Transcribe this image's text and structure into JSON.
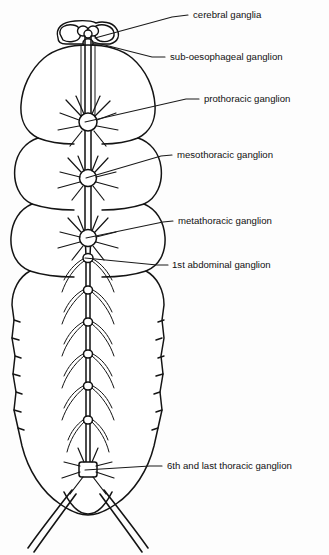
{
  "figure": {
    "background_color": "#fdfdfd",
    "ink_color": "#141414",
    "labels": [
      {
        "id": "cerebral-ganglia",
        "text": "cerebral ganglia",
        "text_x": 193,
        "text_y": 15,
        "leader": "M 188 15 L 172 17 L 95 38"
      },
      {
        "id": "sub-oesophageal-ganglion",
        "text": "sub-oesophageal ganglion",
        "text_x": 170,
        "text_y": 57,
        "leader": "M 165 57 L 152 57 L 93 42"
      },
      {
        "id": "prothoracic-ganglion",
        "text": "prothoracic ganglion",
        "text_x": 204,
        "text_y": 99,
        "leader": "M 199 99 L 186 99 L 85 122"
      },
      {
        "id": "mesothoracic-ganglion",
        "text": "mesothoracic ganglion",
        "text_x": 177,
        "text_y": 155,
        "leader": "M 172 155 L 161 156 L 86 178"
      },
      {
        "id": "metathoracic-ganglion",
        "text": "metathoracic ganglion",
        "text_x": 178,
        "text_y": 221,
        "leader": "M 173 221 L 163 222 L 86 238"
      },
      {
        "id": "first-abdominal-ganglion",
        "text": "1st abdominal ganglion",
        "text_x": 172,
        "text_y": 265,
        "leader": "M 168 265 L 157 265 L 85 258"
      },
      {
        "id": "sixth-and-last-thoracic-ganglion",
        "text": "6th and last thoracic ganglion",
        "text_x": 167,
        "text_y": 466,
        "leader": "M 162 466 L 150 466 L 85 470"
      }
    ],
    "anatomy": {
      "head_label": "head capsule",
      "thorax_label": "thorax",
      "abdomen_label": "abdomen",
      "nerve_cord_label": "ventral nerve cord",
      "cerci_label": "cerci",
      "ganglia_count": 9
    }
  }
}
